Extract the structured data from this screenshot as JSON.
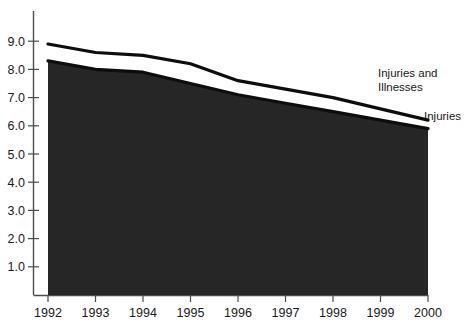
{
  "chart_data": {
    "type": "area",
    "title": "",
    "subtitle": "",
    "xlabel": "",
    "ylabel": "",
    "categories": [
      "1992",
      "1993",
      "1994",
      "1995",
      "1996",
      "1997",
      "1998",
      "1999",
      "2000"
    ],
    "x": [
      1992,
      1993,
      1994,
      1995,
      1996,
      1997,
      1998,
      1999,
      2000
    ],
    "xlim": [
      1992,
      2000
    ],
    "ylim": [
      0,
      9.3
    ],
    "yticks": [
      "1.0",
      "2.0",
      "3.0",
      "4.0",
      "5.0",
      "6.0",
      "7.0",
      "8.0",
      "9.0"
    ],
    "ytick_values": [
      1.0,
      2.0,
      3.0,
      4.0,
      5.0,
      6.0,
      7.0,
      8.0,
      9.0
    ],
    "grid": false,
    "legend_position": "inline-right",
    "series": [
      {
        "name": "Injuries and Illnesses",
        "values": [
          8.9,
          8.6,
          8.5,
          8.2,
          7.6,
          7.3,
          7.0,
          6.6,
          6.2
        ],
        "fill": "#ffffff",
        "stroke": "#0d0d0d"
      },
      {
        "name": "Injuries",
        "values": [
          8.3,
          8.0,
          7.9,
          7.5,
          7.1,
          6.8,
          6.5,
          6.2,
          5.9
        ],
        "fill": "#262626",
        "stroke": "#0d0d0d"
      }
    ],
    "annotations": [
      {
        "text": "Injuries and",
        "series": "Injuries and Illnesses"
      },
      {
        "text": "Illnesses",
        "series": "Injuries and Illnesses"
      },
      {
        "text": "Injuries",
        "series": "Injuries"
      }
    ],
    "colors": {
      "axis": "#4d4d4d",
      "line": "#0d0d0d",
      "fill_lower": "#262626",
      "fill_upper": "#ffffff",
      "text": "#1a1a1a",
      "background": "#ffffff"
    }
  },
  "axis": {
    "y_ticks": [
      {
        "label": "9.0",
        "value": 9.0
      },
      {
        "label": "8.0",
        "value": 8.0
      },
      {
        "label": "7.0",
        "value": 7.0
      },
      {
        "label": "6.0",
        "value": 6.0
      },
      {
        "label": "5.0",
        "value": 5.0
      },
      {
        "label": "4.0",
        "value": 4.0
      },
      {
        "label": "3.0",
        "value": 3.0
      },
      {
        "label": "2.0",
        "value": 2.0
      },
      {
        "label": "1.0",
        "value": 1.0
      }
    ],
    "x_ticks": [
      {
        "label": "1992"
      },
      {
        "label": "1993"
      },
      {
        "label": "1994"
      },
      {
        "label": "1995"
      },
      {
        "label": "1996"
      },
      {
        "label": "1997"
      },
      {
        "label": "1998"
      },
      {
        "label": "1999"
      },
      {
        "label": "2000"
      }
    ]
  },
  "labels": {
    "upper_line_1": "Injuries and",
    "upper_line_2": "Illnesses",
    "lower_line_1": "Injuries"
  }
}
